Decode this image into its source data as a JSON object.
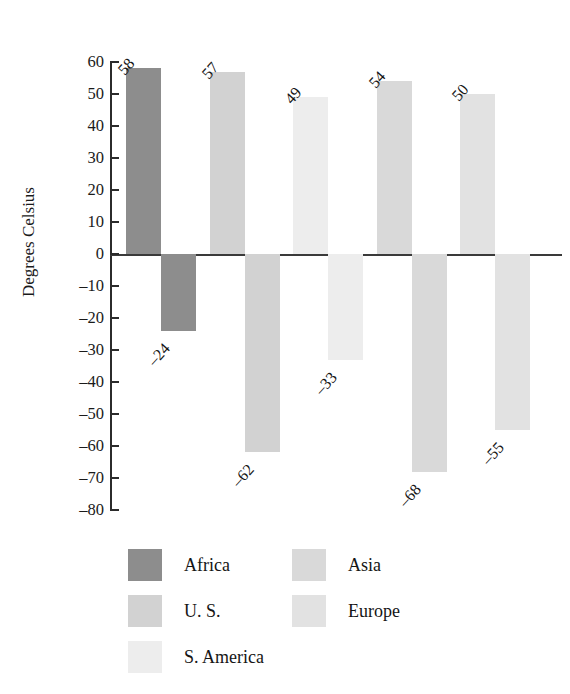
{
  "chart_data": {
    "type": "bar",
    "title": "",
    "subtitle": "",
    "xlabel": "",
    "ylabel": "Degrees Celsius",
    "ylim": [
      -80,
      60
    ],
    "ytick_step": 10,
    "grid": false,
    "legend_position": "bottom",
    "categories": [
      "Record High",
      "Record Low"
    ],
    "series": [
      {
        "name": "Africa",
        "color": "#8d8d8d",
        "values": [
          58,
          -24
        ]
      },
      {
        "name": "U. S.",
        "color": "#d2d2d2",
        "values": [
          57,
          -62
        ]
      },
      {
        "name": "S. America",
        "color": "#ededed",
        "values": [
          49,
          -33
        ]
      },
      {
        "name": "Asia",
        "color": "#d9d9d9",
        "values": [
          54,
          -68
        ]
      },
      {
        "name": "Europe",
        "color": "#e2e2e2",
        "values": [
          50,
          -55
        ]
      }
    ],
    "bars": [
      {
        "region": "Africa",
        "kind": "high",
        "value": 58,
        "label": "58",
        "color": "#8d8d8d"
      },
      {
        "region": "Africa",
        "kind": "low",
        "value": -24,
        "label": "–24",
        "color": "#8d8d8d"
      },
      {
        "region": "U. S.",
        "kind": "high",
        "value": 57,
        "label": "57",
        "color": "#d2d2d2"
      },
      {
        "region": "U. S.",
        "kind": "low",
        "value": -62,
        "label": "–62",
        "color": "#d2d2d2"
      },
      {
        "region": "S. America",
        "kind": "high",
        "value": 49,
        "label": "49",
        "color": "#ededed"
      },
      {
        "region": "S. America",
        "kind": "low",
        "value": -33,
        "label": "–33",
        "color": "#ededed"
      },
      {
        "region": "Asia",
        "kind": "high",
        "value": 54,
        "label": "54",
        "color": "#d9d9d9"
      },
      {
        "region": "Asia",
        "kind": "low",
        "value": -68,
        "label": "–68",
        "color": "#d9d9d9"
      },
      {
        "region": "Europe",
        "kind": "high",
        "value": 50,
        "label": "50",
        "color": "#e2e2e2"
      },
      {
        "region": "Europe",
        "kind": "low",
        "value": -55,
        "label": "–55",
        "color": "#e2e2e2"
      }
    ],
    "ytick_labels": [
      "60",
      "50",
      "40",
      "30",
      "20",
      "10",
      "0",
      "–10",
      "–20",
      "–30",
      "–40",
      "–50",
      "–60",
      "–70",
      "–80"
    ],
    "ytick_values": [
      60,
      50,
      40,
      30,
      20,
      10,
      0,
      -10,
      -20,
      -30,
      -40,
      -50,
      -60,
      -70,
      -80
    ]
  },
  "legend": {
    "items": [
      {
        "label": "Africa",
        "color": "#8d8d8d"
      },
      {
        "label": "Asia",
        "color": "#d9d9d9"
      },
      {
        "label": "U. S.",
        "color": "#d2d2d2"
      },
      {
        "label": "Europe",
        "color": "#e2e2e2"
      },
      {
        "label": "S. America",
        "color": "#ededed"
      }
    ]
  },
  "axis": {
    "y_title": "Degrees Celsius"
  }
}
